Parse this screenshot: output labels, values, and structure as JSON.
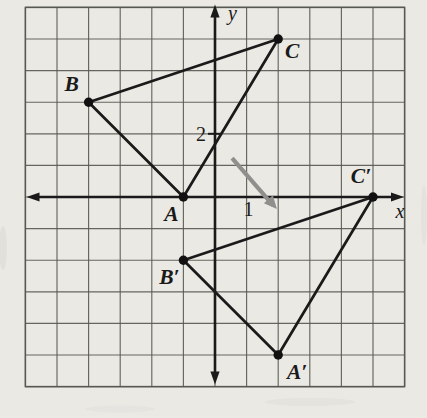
{
  "figure": {
    "axes": {
      "x_label": "x",
      "y_label": "y",
      "x_tick_label": "1",
      "x_tick_value": 1,
      "y_tick_label": "2",
      "y_tick_value": 2
    },
    "grid": {
      "x_min": -6,
      "x_max": 6,
      "y_min": -6,
      "y_max": 6
    },
    "points": [
      {
        "name": "A",
        "label": "A",
        "x": -1,
        "y": 0,
        "label_dx": -12,
        "label_dy": 17
      },
      {
        "name": "B",
        "label": "B",
        "x": -4,
        "y": 3,
        "label_dx": -17,
        "label_dy": -18
      },
      {
        "name": "C",
        "label": "C",
        "x": 2,
        "y": 5,
        "label_dx": 14,
        "label_dy": 12
      },
      {
        "name": "A-prime",
        "label": "A′",
        "x": 2,
        "y": -5,
        "label_dx": 19,
        "label_dy": 17
      },
      {
        "name": "B-prime",
        "label": "B′",
        "x": -1,
        "y": -2,
        "label_dx": -14,
        "label_dy": 17
      },
      {
        "name": "C-prime",
        "label": "C′",
        "x": 5,
        "y": 0,
        "label_dx": -12,
        "label_dy": -21
      }
    ],
    "triangles": [
      {
        "name": "triangle-ABC",
        "vertices": [
          "A",
          "B",
          "C"
        ]
      },
      {
        "name": "triangle-A-prime-B-prime-C-prime",
        "vertices": [
          "A-prime",
          "B-prime",
          "C-prime"
        ]
      }
    ],
    "translation_arrow": {
      "x1": 0.54,
      "y1": 1.23,
      "x2": 1.96,
      "y2": -0.38
    },
    "colors": {
      "background": "#eae9e4",
      "grid_line": "#585852",
      "axis": "#1a1a1a",
      "triangle": "#1a1a1a",
      "point_dot": "#111111",
      "label": "#1a1a1a",
      "translation_arrow": "#8f8f8d"
    }
  }
}
